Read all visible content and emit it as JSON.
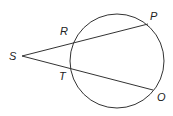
{
  "diagram": {
    "stroke_color": "#333333",
    "circle": {
      "cx": 117,
      "cy": 61,
      "r": 47
    },
    "points": {
      "S": {
        "label": "S",
        "x": 22,
        "y": 56,
        "lx": 9,
        "ly": 60
      },
      "R": {
        "label": "R",
        "x": 73,
        "y": 43,
        "lx": 60,
        "ly": 35
      },
      "P": {
        "label": "P",
        "x": 148,
        "y": 24,
        "lx": 150,
        "ly": 20
      },
      "T": {
        "label": "T",
        "x": 71,
        "y": 69,
        "lx": 59,
        "ly": 80
      },
      "O": {
        "label": "O",
        "x": 153,
        "y": 90,
        "lx": 157,
        "ly": 101
      }
    },
    "segments": [
      {
        "from": "S",
        "to": "P"
      },
      {
        "from": "S",
        "to": "O"
      }
    ]
  }
}
